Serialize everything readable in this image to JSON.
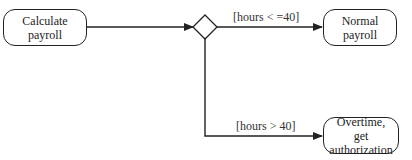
{
  "diagram": {
    "type": "activity",
    "nodes": [
      {
        "id": "calc",
        "label": "Calculate payroll"
      },
      {
        "id": "decision",
        "label": ""
      },
      {
        "id": "normal",
        "label": "Normal payroll"
      },
      {
        "id": "overtime",
        "label": "Overtime,\nget authorization"
      }
    ],
    "edges": [
      {
        "from": "calc",
        "to": "decision",
        "label": ""
      },
      {
        "from": "decision",
        "to": "normal",
        "label": "[hours < =40]"
      },
      {
        "from": "decision",
        "to": "overtime",
        "label": "[hours > 40]"
      }
    ]
  },
  "colors": {
    "stroke": "#222222",
    "fill": "#ffffff"
  }
}
